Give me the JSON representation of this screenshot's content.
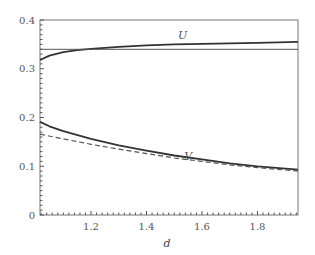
{
  "chart_data": {
    "type": "line",
    "title": "",
    "xlabel": "d",
    "ylabel": "",
    "xlim": [
      1.016,
      1.946
    ],
    "ylim": [
      0,
      0.4
    ],
    "x_ticks": [
      1.2,
      1.4,
      1.6,
      1.8
    ],
    "x_tick_labels": [
      "1.2",
      "1.4",
      "1.6",
      "1.8"
    ],
    "y_ticks": [
      0,
      0.1,
      0.2,
      0.3,
      0.4
    ],
    "y_tick_labels": [
      "0",
      "0.1",
      "0.2",
      "0.3",
      "0.4"
    ],
    "grid": false,
    "legend": null,
    "annotations": [
      {
        "text": "U",
        "x": 1.53,
        "y": 0.362
      },
      {
        "text": "V",
        "x": 1.55,
        "y": 0.113
      }
    ],
    "series": [
      {
        "name": "U",
        "style": "solid",
        "color": "#333333",
        "x": [
          1.016,
          1.05,
          1.1,
          1.15,
          1.2,
          1.3,
          1.4,
          1.5,
          1.6,
          1.7,
          1.8,
          1.946
        ],
        "y": [
          0.318,
          0.327,
          0.334,
          0.338,
          0.341,
          0.345,
          0.348,
          0.35,
          0.351,
          0.352,
          0.353,
          0.355
        ]
      },
      {
        "name": "U reference",
        "style": "solid-thin",
        "color": "#555555",
        "x": [
          1.016,
          1.946
        ],
        "y": [
          0.34,
          0.34
        ]
      },
      {
        "name": "V",
        "style": "solid",
        "color": "#333333",
        "x": [
          1.016,
          1.05,
          1.1,
          1.2,
          1.3,
          1.4,
          1.5,
          1.6,
          1.7,
          1.8,
          1.946
        ],
        "y": [
          0.191,
          0.182,
          0.172,
          0.156,
          0.143,
          0.132,
          0.122,
          0.114,
          0.106,
          0.1,
          0.093
        ]
      },
      {
        "name": "V approx",
        "style": "dashed",
        "color": "#555555",
        "x": [
          1.016,
          1.1,
          1.2,
          1.3,
          1.4,
          1.5,
          1.6,
          1.7,
          1.8,
          1.946
        ],
        "y": [
          0.166,
          0.156,
          0.145,
          0.135,
          0.126,
          0.117,
          0.11,
          0.103,
          0.097,
          0.09
        ]
      }
    ]
  }
}
